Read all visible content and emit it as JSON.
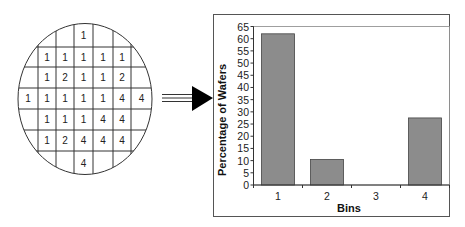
{
  "wafer_map": {
    "rows": [
      [
        "",
        "",
        "",
        "1",
        "",
        "",
        ""
      ],
      [
        "",
        "1",
        "1",
        "1",
        "1",
        "1",
        ""
      ],
      [
        "",
        "1",
        "2",
        "1",
        "1",
        "2",
        ""
      ],
      [
        "1",
        "1",
        "1",
        "1",
        "1",
        "4",
        "4"
      ],
      [
        "",
        "1",
        "1",
        "1",
        "4",
        "4",
        ""
      ],
      [
        "",
        "1",
        "2",
        "4",
        "4",
        "4",
        ""
      ],
      [
        "",
        "",
        "",
        "4",
        "",
        "",
        ""
      ]
    ]
  },
  "arrow": {
    "direction": "right"
  },
  "colors": {
    "bar_fill": "#8c8c8c",
    "bar_stroke": "#444444",
    "line": "#333333"
  },
  "chart_data": {
    "type": "bar",
    "title": "",
    "categories": [
      "1",
      "2",
      "3",
      "4"
    ],
    "values": [
      62,
      10.5,
      0,
      27.5
    ],
    "xlabel": "Bins",
    "ylabel": "Percentage of Wafers",
    "ylim": [
      0,
      65
    ],
    "yticks": [
      0,
      5,
      10,
      15,
      20,
      25,
      30,
      35,
      40,
      45,
      50,
      55,
      60,
      65
    ],
    "grid": false,
    "legend": null
  }
}
